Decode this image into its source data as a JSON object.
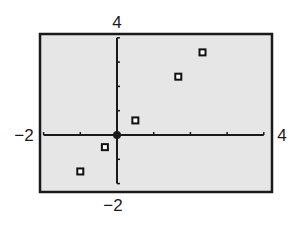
{
  "chart_data": {
    "type": "scatter",
    "title": "",
    "xlabel": "",
    "ylabel": "",
    "xlim": [
      -2,
      4
    ],
    "ylim": [
      -2,
      4
    ],
    "xscale": 1,
    "yscale": 1,
    "grid": false,
    "legend": null,
    "marker": "hollow-square",
    "tick_labels": {
      "x_min": "−2",
      "x_max": "4",
      "y_min": "−2",
      "y_max": "4"
    },
    "series": [
      {
        "name": "data",
        "points": [
          {
            "x": -1.0,
            "y": -1.5
          },
          {
            "x": -0.33,
            "y": -0.5
          },
          {
            "x": 0.5,
            "y": 0.6
          },
          {
            "x": 1.67,
            "y": 2.4
          },
          {
            "x": 2.33,
            "y": 3.4
          }
        ]
      }
    ],
    "colors": {
      "plot_background": "#e6e6e6",
      "frame": "#1a1a1a",
      "axes": "#1a1a1a",
      "marker": "#111111"
    }
  }
}
